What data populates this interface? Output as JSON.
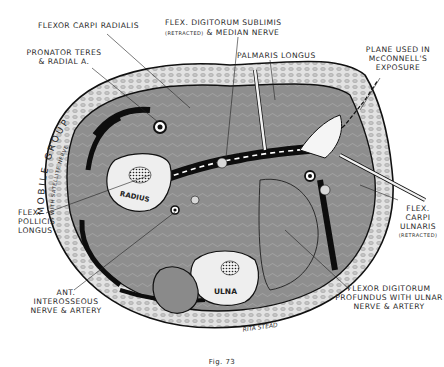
{
  "figure": {
    "type": "anatomical cross-section",
    "labels": {
      "flexor_carpi_radialis": "FLEXOR CARPI RADIALIS",
      "fds_line1": "FLEX. DIGITORUM SUBLIMIS",
      "fds_line2_small": "(RETRACTED)",
      "fds_line2": "& MEDIAN NERVE",
      "pronator_line1": "PRONATOR TERES",
      "pronator_line2": "& RADIAL A.",
      "palmaris_longus": "PALMARIS LONGUS",
      "plane_line1": "PLANE USED IN",
      "plane_line2": "McCONNELL'S",
      "plane_line3": "EXPOSURE",
      "mobile_group": "MOBILE GROUP",
      "mobile_group_sub": "WITH SATELLITE NERVE",
      "radius": "RADIUS",
      "ulna": "ULNA",
      "fpl_line1": "FLEX.",
      "fpl_line2": "POLLICIS",
      "fpl_line3": "LONGUS",
      "fcu_line1": "FLEX.",
      "fcu_line2": "CARPI",
      "fcu_line3": "ULNARIS",
      "fcu_line4": "(RETRACTED)",
      "ant_line1": "ANT.",
      "ant_line2": "INTEROSSEOUS",
      "ant_line3": "NERVE & ARTERY",
      "fdp_line1": "FLEXOR DIGITORUM",
      "fdp_line2": "PROFUNDUS WITH ULNAR",
      "fdp_line3": "NERVE & ARTERY",
      "signature": "RITA STEAD"
    },
    "caption": "Fig. 73",
    "colors": {
      "muscle": "#8a8a8a",
      "muscle_dark": "#6e6e6e",
      "fat": "#d8d8d8",
      "bone": "#eeeeee",
      "ink": "#111111"
    }
  }
}
